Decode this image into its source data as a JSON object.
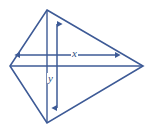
{
  "figure": {
    "type": "geometry-diagram",
    "shape_name": "kite",
    "stroke_color": "#3d5a96",
    "label_color": "#2f4f82",
    "background_color": "#ffffff",
    "canvas": {
      "width": 151,
      "height": 131
    },
    "vertices": [
      {
        "name": "top-vertex",
        "x": 47,
        "y": 10
      },
      {
        "name": "right-vertex",
        "x": 143,
        "y": 66
      },
      {
        "name": "bottom-vertex",
        "x": 47,
        "y": 123
      },
      {
        "name": "left-vertex",
        "x": 10,
        "y": 66
      }
    ],
    "diagonals": [
      {
        "name": "horizontal-diagonal",
        "x1": 10,
        "y1": 66,
        "x2": 143,
        "y2": 66
      },
      {
        "name": "vertical-diagonal",
        "x1": 47,
        "y1": 10,
        "x2": 47,
        "y2": 123
      }
    ],
    "measures": [
      {
        "id": "x",
        "label": "x",
        "orientation": "horizontal",
        "arrow_start": {
          "x": 20,
          "y": 55
        },
        "arrow_end": {
          "x": 115,
          "y": 55
        }
      },
      {
        "id": "y",
        "label": "y",
        "orientation": "vertical",
        "arrow_start": {
          "x": 57,
          "y": 24
        },
        "arrow_end": {
          "x": 57,
          "y": 108
        }
      }
    ]
  }
}
